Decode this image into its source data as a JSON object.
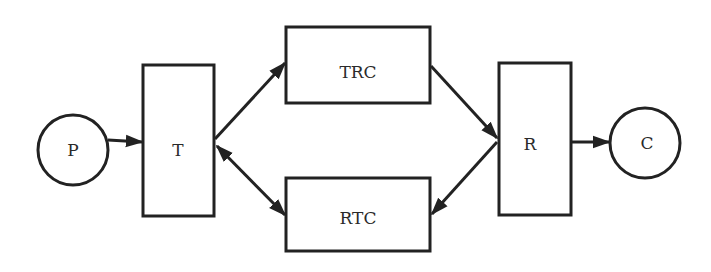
{
  "diagram": {
    "type": "flow",
    "colors": {
      "stroke": "#222222",
      "background": "#ffffff",
      "text": "#2a2a2a"
    },
    "nodes": {
      "P": {
        "label": "P",
        "shape": "circle",
        "cx": 73,
        "cy": 150,
        "r": 35
      },
      "T": {
        "label": "T",
        "shape": "rectangle",
        "x": 143,
        "y": 65,
        "w": 71,
        "h": 151
      },
      "TRC": {
        "label": "TRC",
        "shape": "rectangle",
        "x": 286,
        "y": 27,
        "w": 144,
        "h": 76
      },
      "RTC": {
        "label": "RTC",
        "shape": "rectangle",
        "x": 286,
        "y": 178,
        "w": 144,
        "h": 73
      },
      "R": {
        "label": "R",
        "shape": "rectangle",
        "x": 499,
        "y": 63,
        "w": 72,
        "h": 152
      },
      "C": {
        "label": "C",
        "shape": "circle",
        "cx": 645,
        "cy": 143,
        "r": 35
      }
    },
    "edges": [
      {
        "from": "P",
        "to": "T",
        "direction": "forward"
      },
      {
        "from": "T",
        "to": "TRC",
        "direction": "forward"
      },
      {
        "from": "T",
        "to": "RTC",
        "direction": "both"
      },
      {
        "from": "TRC",
        "to": "R",
        "direction": "forward"
      },
      {
        "from": "R",
        "to": "RTC",
        "direction": "forward"
      },
      {
        "from": "R",
        "to": "C",
        "direction": "forward"
      }
    ]
  }
}
